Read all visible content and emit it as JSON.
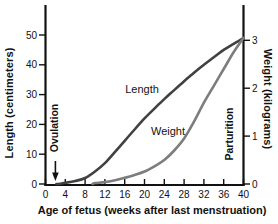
{
  "chart_data": {
    "type": "line",
    "title": "",
    "xlabel": "Age of fetus (weeks after last menstruation)",
    "x_ticks": [
      0,
      4,
      8,
      12,
      16,
      20,
      24,
      28,
      32,
      36,
      40
    ],
    "xlim": [
      0,
      40
    ],
    "grid": false,
    "y_axis_left": {
      "label": "Length (centimeters)",
      "ticks": [
        0,
        10,
        20,
        30,
        40,
        50
      ],
      "lim": [
        0,
        50
      ]
    },
    "y_axis_right": {
      "label": "Weight (kilograms)",
      "ticks": [
        0,
        1,
        2,
        3
      ],
      "lim": [
        0,
        3
      ]
    },
    "series": [
      {
        "name": "Length",
        "curve_label": "Length",
        "axis": "left",
        "unit": "cm",
        "color": "#414141",
        "points": [
          [
            2.2,
            0
          ],
          [
            3,
            0.1
          ],
          [
            4,
            0.4
          ],
          [
            6,
            1
          ],
          [
            8,
            2
          ],
          [
            10,
            4.2
          ],
          [
            12,
            7
          ],
          [
            14,
            10.7
          ],
          [
            16,
            14.5
          ],
          [
            18,
            18.3
          ],
          [
            20,
            22
          ],
          [
            22,
            25.3
          ],
          [
            24,
            28.5
          ],
          [
            26,
            31.5
          ],
          [
            28,
            34.5
          ],
          [
            30,
            37.3
          ],
          [
            32,
            40
          ],
          [
            34,
            42.5
          ],
          [
            36,
            45
          ],
          [
            38,
            47
          ],
          [
            40,
            49
          ]
        ]
      },
      {
        "name": "Weight",
        "curve_label": "Weight",
        "axis": "right",
        "unit": "kg",
        "color": "#7d7d7d",
        "points": [
          [
            9.5,
            0
          ],
          [
            10,
            0.02
          ],
          [
            12,
            0.04
          ],
          [
            14,
            0.08
          ],
          [
            16,
            0.13
          ],
          [
            18,
            0.19
          ],
          [
            20,
            0.26
          ],
          [
            22,
            0.37
          ],
          [
            24,
            0.5
          ],
          [
            26,
            0.7
          ],
          [
            28,
            0.95
          ],
          [
            30,
            1.3
          ],
          [
            32,
            1.7
          ],
          [
            34,
            2.05
          ],
          [
            36,
            2.4
          ],
          [
            38,
            2.75
          ],
          [
            40,
            3.05
          ]
        ]
      }
    ],
    "annotations": [
      {
        "id": "ovulation",
        "text": "Ovulation",
        "week": 2,
        "style": "vertical-label-with-down-arrow"
      },
      {
        "id": "parturition",
        "text": "Parturition",
        "week": 37.2,
        "style": "vertical-label"
      }
    ],
    "colors": {
      "axis": "#111111",
      "text": "#111111",
      "background": "#ffffff"
    }
  }
}
